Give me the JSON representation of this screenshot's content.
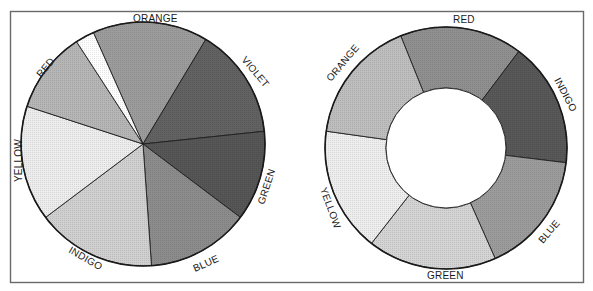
{
  "chart_data": [
    {
      "type": "pie",
      "title": "",
      "center": [
        143,
        144
      ],
      "radius": 122,
      "inner_radius": 0,
      "slices": [
        {
          "label": "ORANGE",
          "start_deg": 336,
          "end_deg": 391,
          "value_deg": 55,
          "shade": "#9c9c9c"
        },
        {
          "label": "VIOLET",
          "start_deg": 31,
          "end_deg": 84,
          "value_deg": 53,
          "shade": "#626262"
        },
        {
          "label": "GREEN",
          "start_deg": 84,
          "end_deg": 127,
          "value_deg": 43,
          "shade": "#565656"
        },
        {
          "label": "BLUE",
          "start_deg": 127,
          "end_deg": 176,
          "value_deg": 49,
          "shade": "#8c8c8c"
        },
        {
          "label": "INDIGO",
          "start_deg": 176,
          "end_deg": 233,
          "value_deg": 57,
          "shade": "#d0d0d0"
        },
        {
          "label": "YELLOW",
          "start_deg": 233,
          "end_deg": 288,
          "value_deg": 55,
          "shade": "#ededed"
        },
        {
          "label": "RED",
          "start_deg": 288,
          "end_deg": 327,
          "value_deg": 39,
          "shade": "#b6b6b6"
        },
        {
          "label": "",
          "start_deg": 327,
          "end_deg": 336,
          "value_deg": 9,
          "shade": "#ffffff"
        }
      ],
      "legend": "labels on rim"
    },
    {
      "type": "pie",
      "subtype": "donut",
      "title": "",
      "center": [
        446,
        148
      ],
      "radius": 121,
      "inner_radius": 60,
      "slices": [
        {
          "label": "RED",
          "start_deg": 338,
          "end_deg": 397,
          "value_deg": 59,
          "shade": "#909090"
        },
        {
          "label": "INDIGO",
          "start_deg": 37,
          "end_deg": 97,
          "value_deg": 60,
          "shade": "#585858"
        },
        {
          "label": "BLUE",
          "start_deg": 97,
          "end_deg": 156,
          "value_deg": 59,
          "shade": "#9c9c9c"
        },
        {
          "label": "GREEN",
          "start_deg": 156,
          "end_deg": 218,
          "value_deg": 62,
          "shade": "#d4d4d4"
        },
        {
          "label": "YELLOW",
          "start_deg": 218,
          "end_deg": 278,
          "value_deg": 60,
          "shade": "#eeeeee"
        },
        {
          "label": "ORANGE",
          "start_deg": 278,
          "end_deg": 338,
          "value_deg": 60,
          "shade": "#bebebe"
        }
      ],
      "legend": "labels on rim"
    }
  ],
  "labels": {
    "left": {
      "orange": "ORANGE",
      "violet": "VIOLET",
      "green": "GREEN",
      "blue": "BLUE",
      "indigo": "INDIGO",
      "yellow": "YELLOW",
      "red": "RED"
    },
    "right": {
      "red": "RED",
      "indigo": "INDIGO",
      "blue": "BLUE",
      "green": "GREEN",
      "yellow": "YELLOW",
      "orange": "ORANGE"
    }
  }
}
